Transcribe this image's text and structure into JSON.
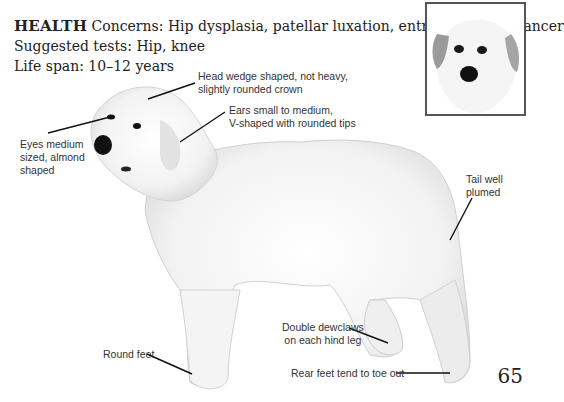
{
  "health": {
    "heading": "HEALTH",
    "concerns": "Concerns: Hip dysplasia, patellar luxation, entropion, bone cancer",
    "suggested_tests": "Suggested tests: Hip, knee",
    "life_span": "Life span: 10–12 years"
  },
  "callouts": {
    "head": [
      "Head wedge shaped, not heavy,",
      "slightly rounded crown"
    ],
    "ears": [
      "Ears small to medium,",
      "V-shaped with rounded tips"
    ],
    "eyes": [
      "Eyes medium",
      "sized, almond",
      "shaped"
    ],
    "tail": [
      "Tail well",
      "plumed"
    ],
    "dewclaws": [
      "Double dewclaws",
      "on each hind leg"
    ],
    "round_feet": [
      "Round feet"
    ],
    "rear_feet": [
      "Rear feet tend to toe out"
    ]
  },
  "page_number": "65",
  "images": {
    "main": "great-pyrenees-full-body-photo",
    "inset": "great-pyrenees-head-portrait"
  },
  "colors": {
    "text": "#222222",
    "callout_text": "#333333",
    "leader_line": "#111111",
    "inset_border": "#555555"
  }
}
